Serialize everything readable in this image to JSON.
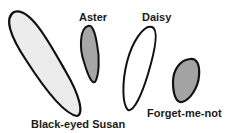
{
  "diagram": {
    "shapes": [
      {
        "id": "black-eyed-susan",
        "label": "Black-eyed Susan",
        "fill": "#ececec",
        "stroke": "#111111"
      },
      {
        "id": "aster",
        "label": "Aster",
        "fill": "#a6a6a6",
        "stroke": "#111111"
      },
      {
        "id": "daisy",
        "label": "Daisy",
        "fill": "#ffffff",
        "stroke": "#111111"
      },
      {
        "id": "forget-me-not",
        "label": "Forget-me-not",
        "fill": "#a3a3a3",
        "stroke": "#111111"
      }
    ]
  }
}
